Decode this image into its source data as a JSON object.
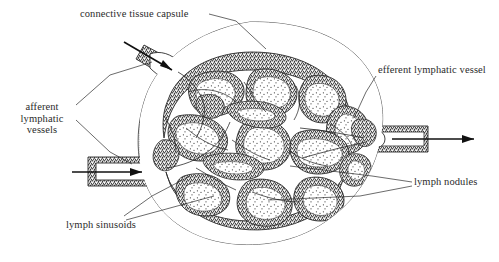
{
  "figure": {
    "background_color": "#ffffff",
    "ink_color": "#2b2b2b"
  },
  "labels": {
    "capsule": "connective tissue capsule",
    "efferent": "efferent lymphatic vessel",
    "afferent_line1": "afferent",
    "afferent_line2": "lymphatic",
    "afferent_line3": "vessels",
    "nodules": "lymph nodules",
    "sinusoids": "lymph sinusoids"
  },
  "structures": {
    "capsule_name": "connective-tissue-capsule",
    "node_body_name": "lymph-node-body",
    "afferent_upper_name": "afferent-lymphatic-vessel-upper",
    "afferent_lower_name": "afferent-lymphatic-vessel-lower",
    "efferent_name": "efferent-lymphatic-vessel",
    "nodule_count": 16,
    "flow_arrows": [
      {
        "name": "afferent-flow-arrow-upper",
        "direction": "inward"
      },
      {
        "name": "afferent-flow-arrow-lower",
        "direction": "inward"
      },
      {
        "name": "efferent-flow-arrow",
        "direction": "outward"
      }
    ]
  }
}
